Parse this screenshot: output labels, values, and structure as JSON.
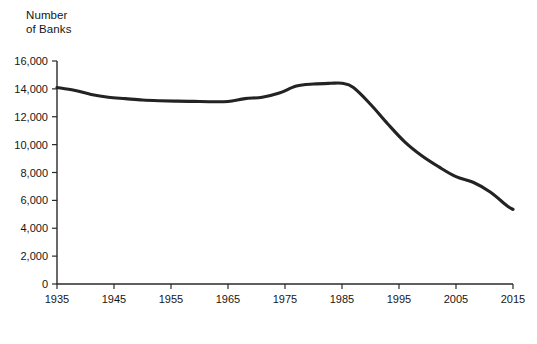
{
  "chart_data": {
    "type": "line",
    "title": "",
    "ylabel": "Number\nof Banks",
    "xlabel": "",
    "ylim": [
      0,
      16000
    ],
    "xlim": [
      1935,
      2015
    ],
    "grid": false,
    "legend": "none",
    "line_color": "#232323",
    "yticks": [
      "0",
      "2,000",
      "4,000",
      "6,000",
      "8,000",
      "10,000",
      "12,000",
      "14,000",
      "16,000"
    ],
    "ytick_values": [
      0,
      2000,
      4000,
      6000,
      8000,
      10000,
      12000,
      14000,
      16000
    ],
    "xticks": [
      "1935",
      "1945",
      "1955",
      "1965",
      "1975",
      "1985",
      "1995",
      "2005",
      "2015"
    ],
    "xtick_values": [
      1935,
      1945,
      1955,
      1965,
      1975,
      1985,
      1995,
      2005,
      2015
    ],
    "series": [
      {
        "name": "Number of Banks",
        "x": [
          1935,
          1938,
          1941,
          1944,
          1947,
          1950,
          1953,
          1956,
          1959,
          1962,
          1965,
          1968,
          1971,
          1974,
          1977,
          1980,
          1983,
          1985,
          1987,
          1990,
          1993,
          1996,
          1999,
          2002,
          2005,
          2008,
          2011,
          2014,
          2015
        ],
        "values": [
          14100,
          13900,
          13600,
          13400,
          13300,
          13200,
          13150,
          13120,
          13100,
          13080,
          13100,
          13300,
          13400,
          13700,
          14200,
          14350,
          14400,
          14400,
          14100,
          12900,
          11500,
          10200,
          9200,
          8400,
          7700,
          7300,
          6600,
          5600,
          5350
        ]
      }
    ]
  }
}
